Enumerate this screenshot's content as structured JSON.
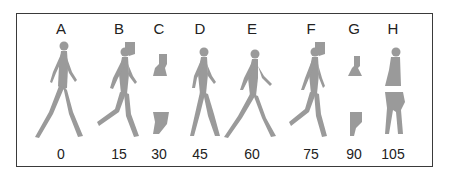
{
  "figure": {
    "panels": [
      {
        "letter": "A",
        "value": "0",
        "pose": "full-walk"
      },
      {
        "letter": "B",
        "value": "15",
        "pose": "full-walk-stride"
      },
      {
        "letter": "C",
        "value": "30",
        "pose": "partial-fragments"
      },
      {
        "letter": "D",
        "value": "45",
        "pose": "full-walk"
      },
      {
        "letter": "E",
        "value": "60",
        "pose": "full-walk"
      },
      {
        "letter": "F",
        "value": "75",
        "pose": "full-walk-stride"
      },
      {
        "letter": "G",
        "value": "90",
        "pose": "partial-fragments"
      },
      {
        "letter": "H",
        "value": "105",
        "pose": "split-torso-legs"
      }
    ],
    "colors": {
      "silhouette": "#9a9a9a",
      "border": "#3a3a3a",
      "text": "#222222"
    }
  }
}
